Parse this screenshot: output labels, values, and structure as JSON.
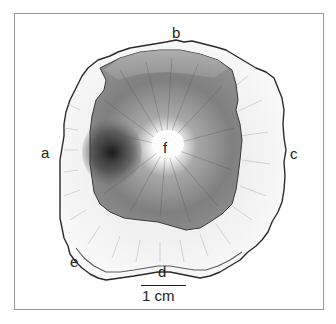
{
  "figure": {
    "labels": {
      "a": "a",
      "b": "b",
      "c": "c",
      "d": "d",
      "e": "e",
      "f": "f"
    },
    "scale_bar": {
      "label": "1 cm"
    },
    "colors": {
      "outline": "#2a2a2a",
      "outer_band": "#f4f4f4",
      "inner_core": "#7a7a7a",
      "dark_patch": "#1e1e1e",
      "center": "#ffffff",
      "frame": "#9a9a9a"
    }
  }
}
